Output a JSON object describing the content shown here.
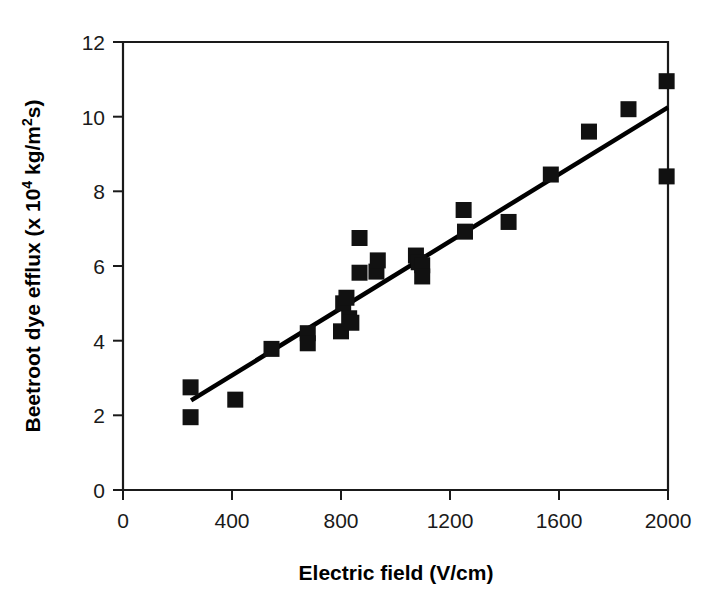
{
  "chart_data": {
    "type": "scatter",
    "title": "",
    "xlabel": "Electric field (V/cm)",
    "ylabel_main": "Beetroot dye efflux (x 10",
    "ylabel_sup": "4",
    "ylabel_tail": " kg/m",
    "ylabel_sup2": "2",
    "ylabel_tail2": "s)",
    "ylabel": "Beetroot dye efflux (x 10^4 kg/m^2 s)",
    "xlim": [
      0,
      2000
    ],
    "ylim": [
      0,
      12
    ],
    "xticks": [
      0,
      400,
      800,
      1200,
      1600,
      2000
    ],
    "yticks": [
      0,
      2,
      4,
      6,
      8,
      10,
      12
    ],
    "xtick_labels": [
      "0",
      "400",
      "800",
      "1200",
      "1600",
      "2000"
    ],
    "ytick_labels": [
      "0",
      "2",
      "4",
      "6",
      "8",
      "10",
      "12"
    ],
    "grid": false,
    "legend": false,
    "marker": "filled-square",
    "marker_color": "#111111",
    "marker_size_px": 16,
    "x": [
      248,
      248,
      412,
      545,
      678,
      678,
      800,
      808,
      820,
      830,
      838,
      868,
      868,
      930,
      935,
      1075,
      1085,
      1098,
      1098,
      1250,
      1255,
      1415,
      1570,
      1710,
      1855,
      1995,
      1995
    ],
    "y": [
      2.75,
      1.95,
      2.42,
      3.78,
      4.2,
      3.93,
      4.25,
      5.0,
      5.15,
      4.6,
      4.48,
      6.75,
      5.82,
      5.85,
      6.15,
      6.28,
      6.1,
      6.02,
      5.72,
      7.5,
      6.92,
      7.18,
      8.45,
      9.6,
      10.2,
      10.95,
      8.4
    ],
    "points": [
      {
        "x": 248,
        "y": 2.75
      },
      {
        "x": 248,
        "y": 1.95
      },
      {
        "x": 412,
        "y": 2.42
      },
      {
        "x": 545,
        "y": 3.78
      },
      {
        "x": 678,
        "y": 4.2
      },
      {
        "x": 678,
        "y": 3.93
      },
      {
        "x": 800,
        "y": 4.25
      },
      {
        "x": 808,
        "y": 5.0
      },
      {
        "x": 820,
        "y": 5.15
      },
      {
        "x": 830,
        "y": 4.6
      },
      {
        "x": 838,
        "y": 4.48
      },
      {
        "x": 868,
        "y": 6.75
      },
      {
        "x": 868,
        "y": 5.82
      },
      {
        "x": 930,
        "y": 5.85
      },
      {
        "x": 935,
        "y": 6.15
      },
      {
        "x": 1075,
        "y": 6.28
      },
      {
        "x": 1085,
        "y": 6.1
      },
      {
        "x": 1098,
        "y": 6.02
      },
      {
        "x": 1098,
        "y": 5.72
      },
      {
        "x": 1250,
        "y": 7.5
      },
      {
        "x": 1255,
        "y": 6.92
      },
      {
        "x": 1415,
        "y": 7.18
      },
      {
        "x": 1570,
        "y": 8.45
      },
      {
        "x": 1710,
        "y": 9.6
      },
      {
        "x": 1855,
        "y": 10.2
      },
      {
        "x": 1995,
        "y": 10.95
      },
      {
        "x": 1995,
        "y": 8.4
      }
    ],
    "trend_line": {
      "x0": 250,
      "y0": 2.4,
      "x1": 2000,
      "y1": 10.25,
      "color": "#000000"
    }
  }
}
